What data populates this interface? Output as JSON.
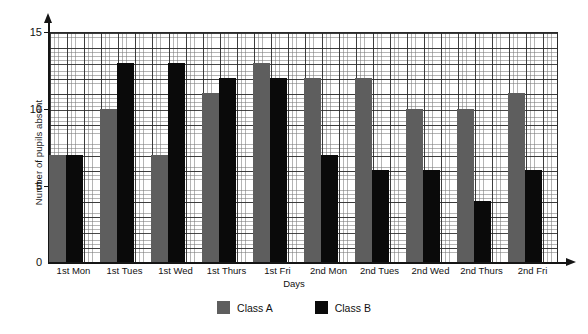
{
  "chart_data": {
    "type": "bar",
    "title": "",
    "subtitle": "",
    "xlabel": "Days",
    "ylabel": "Number of pupils absent",
    "categories": [
      "1st Mon",
      "1st Tues",
      "1st Wed",
      "1st Thurs",
      "1st Fri",
      "2nd Mon",
      "2nd Tues",
      "2nd Wed",
      "2nd Thurs",
      "2nd Fri"
    ],
    "series": [
      {
        "name": "Class A",
        "color": "#5e5e5e",
        "values": [
          7,
          10,
          7,
          11,
          13,
          12,
          12,
          10,
          10,
          11
        ]
      },
      {
        "name": "Class B",
        "color": "#0a0a0a",
        "values": [
          7,
          13,
          13,
          12,
          12,
          7,
          6,
          6,
          4,
          6
        ]
      }
    ],
    "ylim": [
      0,
      15
    ],
    "yticks": [
      0,
      5,
      10,
      15
    ],
    "ytick_labels": [
      "0",
      "5",
      "10",
      "15"
    ],
    "y_minor_step": 1,
    "grid": true,
    "grid_minor": true,
    "legend_position": "bottom-center",
    "axis_arrows": true
  },
  "legend": {
    "items": [
      {
        "label": "Class A",
        "color": "#5e5e5e"
      },
      {
        "label": "Class B",
        "color": "#0a0a0a"
      }
    ]
  },
  "axes": {
    "y_title": "Number of pupils absent",
    "x_title": "Days"
  }
}
